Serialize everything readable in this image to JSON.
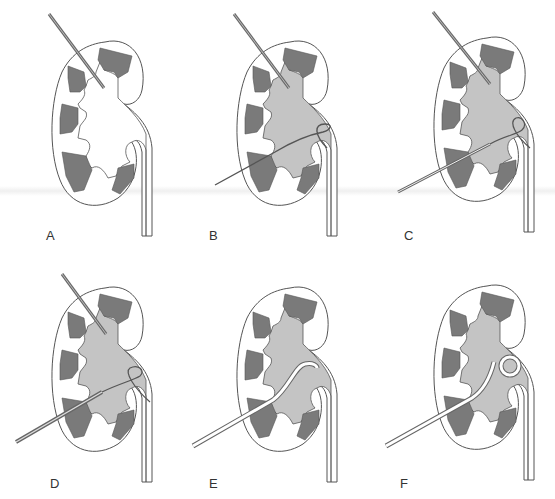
{
  "figure": {
    "colors": {
      "outline": "#555555",
      "pyramid": "#7a7a7a",
      "collecting_system": "#c4c4c4",
      "background": "#ffffff",
      "needle": "#6a6a6a"
    },
    "panels": [
      {
        "label": "A",
        "step": "needle-in-calyx",
        "collecting_system_filled": false
      },
      {
        "label": "B",
        "step": "guidewire-coiled-in-pelvis",
        "collecting_system_filled": true
      },
      {
        "label": "C",
        "step": "sheath-over-guidewire",
        "collecting_system_filled": true
      },
      {
        "label": "D",
        "step": "dilator-over-guidewire",
        "collecting_system_filled": true
      },
      {
        "label": "E",
        "step": "catheter-in-pelvis",
        "collecting_system_filled": true
      },
      {
        "label": "F",
        "step": "pigtail-catheter-coiled",
        "collecting_system_filled": true
      }
    ]
  }
}
